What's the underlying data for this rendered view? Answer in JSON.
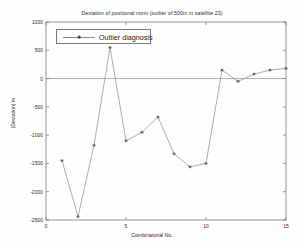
{
  "chart_data": {
    "type": "line",
    "title": "Deviation of positional norm (outlier of 500m in satellite 23)",
    "xlabel": "Combinatorial No.",
    "ylabel": "|Deviation| m",
    "legend": [
      "Outlier diagnosis"
    ],
    "legend_position": "top-left",
    "grid": false,
    "xlim": [
      0,
      15
    ],
    "ylim": [
      -2500,
      1000
    ],
    "xticks": [
      "0",
      "5",
      "10",
      "15"
    ],
    "xtick_values": [
      0,
      5,
      10,
      15
    ],
    "yticks": [
      "1000",
      "500",
      "0",
      "-500",
      "-1000",
      "-1500",
      "-2000",
      "-2500"
    ],
    "ytick_values": [
      1000,
      500,
      0,
      -500,
      -1000,
      -1500,
      -2000,
      -2500
    ],
    "series": [
      {
        "name": "Outlier diagnosis",
        "x": [
          1,
          2,
          3,
          4,
          5,
          6,
          7,
          8,
          9,
          10,
          11,
          12,
          13,
          14,
          15
        ],
        "values": [
          -1450,
          -2440,
          -1180,
          550,
          -1100,
          -950,
          -680,
          -1330,
          -1560,
          -1500,
          150,
          -50,
          80,
          150,
          180
        ],
        "color": "#8a8a8a",
        "marker": "star",
        "marker_color": "#3a3a3a"
      }
    ],
    "zero_line": 0,
    "zero_line_color": "#8a8a8a"
  },
  "colors": {
    "axis": "#6a6a6a",
    "text": "#2a2a2a",
    "background": "#fefefe",
    "line": "#8a8a8a"
  }
}
